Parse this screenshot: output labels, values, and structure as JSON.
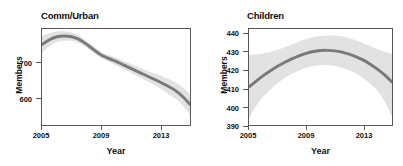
{
  "figure": {
    "panel_count": 2,
    "band_color": "#e2e2e2",
    "line_color": "#7a7a7a",
    "frame_color": "#585858"
  },
  "chart_data": [
    {
      "type": "line",
      "title": "Comm/Urban",
      "xlabel": "Year",
      "ylabel": "Members",
      "xlim": [
        2005,
        2015
      ],
      "ylim": [
        540,
        762
      ],
      "xticks": [
        2005,
        2009,
        2013
      ],
      "xtick_labels": [
        "2005",
        "2009",
        "2013"
      ],
      "yticks": [
        600,
        700
      ],
      "ytick_labels": [
        "600",
        "700"
      ],
      "grid": false,
      "legend": "none",
      "x": [
        2005,
        2005.5,
        2006,
        2006.5,
        2007,
        2007.5,
        2008,
        2008.5,
        2009,
        2009.5,
        2010,
        2010.5,
        2011,
        2011.5,
        2012,
        2012.5,
        2013,
        2013.5,
        2014,
        2014.5,
        2015
      ],
      "values": [
        726,
        737,
        744,
        746,
        744,
        738,
        727,
        714,
        702,
        694,
        687,
        679,
        671,
        663,
        655,
        647,
        639,
        630,
        620,
        606,
        588
      ],
      "ci_lower": [
        706,
        722,
        732,
        735,
        734,
        729,
        719,
        707,
        695,
        686,
        678,
        670,
        661,
        652,
        643,
        634,
        624,
        613,
        601,
        585,
        565
      ],
      "ci_upper": [
        746,
        752,
        756,
        757,
        754,
        747,
        735,
        721,
        709,
        702,
        696,
        688,
        681,
        674,
        667,
        660,
        654,
        647,
        639,
        627,
        611
      ]
    },
    {
      "type": "line",
      "title": "Children",
      "xlabel": "Year",
      "ylabel": "Members",
      "xlim": [
        2005,
        2015
      ],
      "ylim": [
        388,
        446
      ],
      "xticks": [
        2005,
        2009,
        2013
      ],
      "xtick_labels": [
        "2005",
        "2009",
        "2013"
      ],
      "yticks": [
        390,
        400,
        410,
        420,
        430,
        440
      ],
      "ytick_labels": [
        "390",
        "400",
        "410",
        "420",
        "430",
        "440"
      ],
      "grid": false,
      "legend": "none",
      "x": [
        2005,
        2005.5,
        2006,
        2006.5,
        2007,
        2007.5,
        2008,
        2008.5,
        2009,
        2009.5,
        2010,
        2010.5,
        2011,
        2011.5,
        2012,
        2012.5,
        2013,
        2013.5,
        2014,
        2014.5,
        2015
      ],
      "values": [
        411.0,
        414.5,
        417.8,
        420.8,
        423.5,
        425.9,
        428.0,
        429.8,
        431.3,
        432.4,
        433.0,
        433.1,
        432.8,
        432.0,
        430.8,
        429.2,
        427.2,
        424.6,
        421.6,
        418.1,
        414.0
      ],
      "ci_lower": [
        392.0,
        399.5,
        405.0,
        409.5,
        413.3,
        416.4,
        419.0,
        421.0,
        422.6,
        423.6,
        424.1,
        424.1,
        423.6,
        422.6,
        421.1,
        419.0,
        416.3,
        412.8,
        408.4,
        402.0,
        393.0
      ],
      "ci_upper": [
        430.5,
        430.8,
        431.2,
        432.1,
        433.4,
        435.0,
        436.8,
        438.5,
        440.0,
        441.1,
        441.8,
        442.1,
        442.0,
        441.4,
        440.4,
        439.0,
        437.4,
        435.6,
        433.8,
        432.2,
        431.0
      ]
    }
  ]
}
